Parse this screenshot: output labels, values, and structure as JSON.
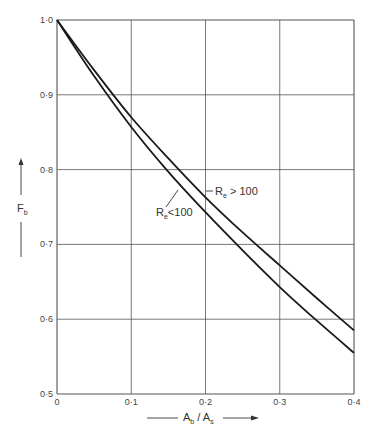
{
  "chart_data": {
    "type": "line",
    "title": "",
    "xlabel": "A_b / A_s",
    "ylabel": "F_b",
    "xlim": [
      0,
      0.4
    ],
    "ylim": [
      0.5,
      1.0
    ],
    "grid": true,
    "x_ticks": [
      "0",
      "0·1",
      "0·2",
      "0·3",
      "0·4"
    ],
    "y_ticks": [
      "0·5",
      "0·6",
      "0·7",
      "0·8",
      "0·9",
      "1·0"
    ],
    "x": [
      0,
      0.05,
      0.1,
      0.15,
      0.2,
      0.25,
      0.3,
      0.35,
      0.4
    ],
    "series": [
      {
        "name": "Re > 100",
        "values": [
          1.0,
          0.933,
          0.87,
          0.815,
          0.763,
          0.716,
          0.672,
          0.628,
          0.585
        ]
      },
      {
        "name": "Re < 100",
        "values": [
          1.0,
          0.925,
          0.857,
          0.797,
          0.743,
          0.692,
          0.643,
          0.598,
          0.555
        ]
      }
    ],
    "annotations": [
      {
        "text": "Re > 100",
        "main": "R",
        "sub": "e",
        "rest": " > 100",
        "target": "Re > 100"
      },
      {
        "text": "Re < 100",
        "main": "R",
        "sub": "e",
        "rest": "<100",
        "target": "Re < 100"
      }
    ],
    "legend": "none (inline annotations)"
  },
  "axis": {
    "x_label_main_a": "A",
    "x_label_sub_a": "b",
    "x_label_sep": " / ",
    "x_label_main_b": "A",
    "x_label_sub_b": "s",
    "y_label_main": "F",
    "y_label_sub": "b"
  },
  "colors": {
    "curve": "#1a1a1a",
    "grid": "#555555",
    "text": "#444444"
  }
}
